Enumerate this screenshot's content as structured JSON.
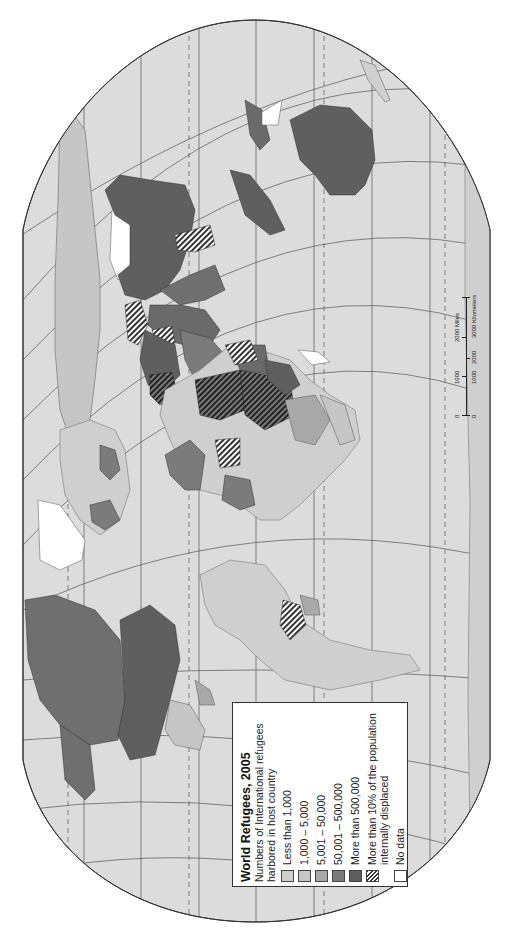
{
  "map": {
    "title": "World Refugees, 2005",
    "orientation": "rotated 90° counter-clockwise (north to the left)",
    "projection_shape": "pseudo-cylindrical, clipped at left and right",
    "ocean_color": "#dcdcdc",
    "graticule_color": "#555555"
  },
  "legend": {
    "title": "World Refugees, 2005",
    "subtitle_line1": "Numbers of International refugees",
    "subtitle_line2": "harbored in host country",
    "items": [
      {
        "label": "Less than 1,000",
        "color": "#cfcfcf",
        "pattern": "solid"
      },
      {
        "label": "1,000 – 5,000",
        "color": "#c6c6c6",
        "pattern": "solid"
      },
      {
        "label": "5,001 – 50,000",
        "color": "#a9a9a9",
        "pattern": "solid"
      },
      {
        "label": "50,001 – 500,000",
        "color": "#7b7b7b",
        "pattern": "solid"
      },
      {
        "label": "More than 500,000",
        "color": "#5f5f5f",
        "pattern": "solid"
      },
      {
        "label_line1": "More than 10% of the population",
        "label_line2": "internally displaced",
        "color": "#333333",
        "pattern": "hatch"
      },
      {
        "label": "No data",
        "color": "#ffffff",
        "pattern": "solid"
      }
    ]
  },
  "scale_bar": {
    "miles_label": "2000 Miles",
    "miles_ticks": [
      "0",
      "1000",
      "2000"
    ],
    "km_label": "3000 Kilometers",
    "km_ticks": [
      "0",
      "1000",
      "2000",
      "3000"
    ]
  }
}
